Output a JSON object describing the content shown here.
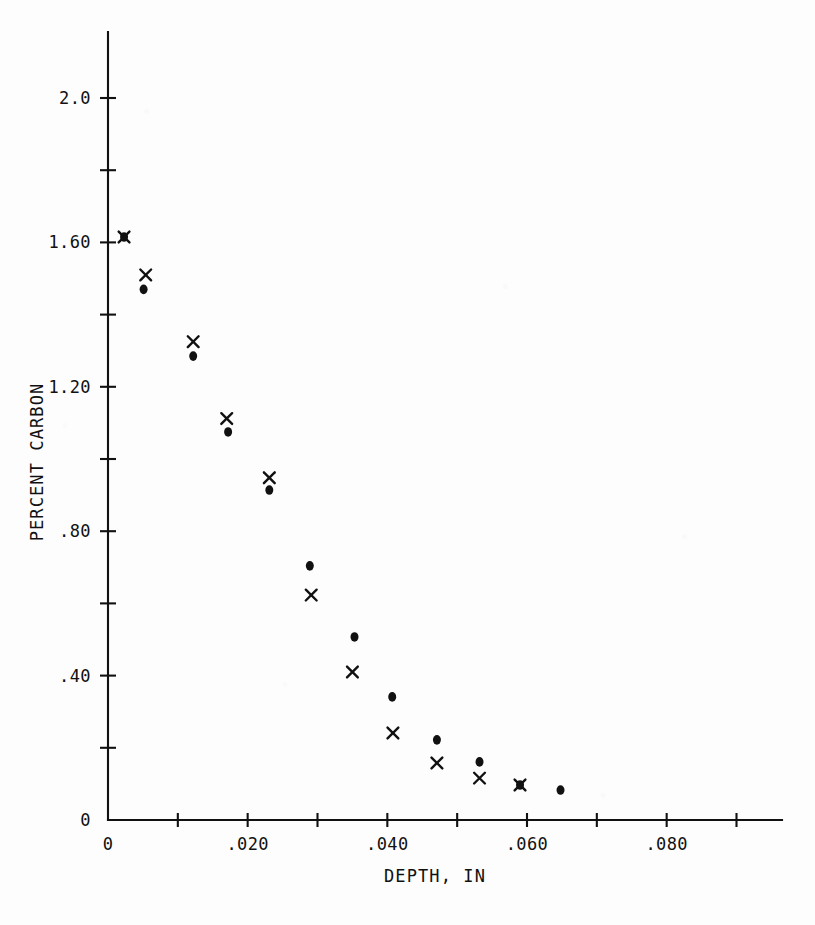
{
  "figure": {
    "background_color": "#fdfdfd",
    "ink_color": "#111111"
  },
  "axes": {
    "x": {
      "title": "DEPTH, IN",
      "tick_labels": [
        "0",
        ".020",
        ".040",
        ".060",
        ".080"
      ],
      "tick_values": [
        0,
        0.02,
        0.04,
        0.06,
        0.08
      ],
      "minor_tick_values": [
        0.01,
        0.03,
        0.05,
        0.07,
        0.09
      ],
      "range": [
        0,
        0.095
      ]
    },
    "y": {
      "title": "PERCENT CARBON",
      "tick_labels": [
        "0",
        ".40",
        ".80",
        "1.20",
        "1.60",
        "2.0"
      ],
      "tick_values": [
        0,
        0.4,
        0.8,
        1.2,
        1.6,
        2.0
      ],
      "minor_tick_values": [
        0.2,
        0.6,
        1.0,
        1.4,
        1.8
      ],
      "range": [
        0,
        2.2
      ]
    }
  },
  "chart_data": {
    "type": "scatter",
    "title": "",
    "xlabel": "DEPTH, IN",
    "ylabel": "PERCENT CARBON",
    "xlim": [
      0,
      0.095
    ],
    "ylim": [
      0,
      2.2
    ],
    "grid": false,
    "legend": "none",
    "series": [
      {
        "name": "x-series",
        "marker": "x",
        "points": [
          {
            "x": 0.0023,
            "y": 1.615
          },
          {
            "x": 0.0054,
            "y": 1.51
          },
          {
            "x": 0.0122,
            "y": 1.325
          },
          {
            "x": 0.017,
            "y": 1.112
          },
          {
            "x": 0.0231,
            "y": 0.948
          },
          {
            "x": 0.0291,
            "y": 0.623
          },
          {
            "x": 0.035,
            "y": 0.41
          },
          {
            "x": 0.0408,
            "y": 0.241
          },
          {
            "x": 0.0471,
            "y": 0.158
          },
          {
            "x": 0.0532,
            "y": 0.116
          },
          {
            "x": 0.059,
            "y": 0.097
          }
        ]
      },
      {
        "name": "dot-series",
        "marker": "filled-circle",
        "points": [
          {
            "x": 0.0023,
            "y": 1.615
          },
          {
            "x": 0.0051,
            "y": 1.47
          },
          {
            "x": 0.0122,
            "y": 1.285
          },
          {
            "x": 0.0172,
            "y": 1.075
          },
          {
            "x": 0.0231,
            "y": 0.914
          },
          {
            "x": 0.0289,
            "y": 0.704
          },
          {
            "x": 0.0353,
            "y": 0.507
          },
          {
            "x": 0.0407,
            "y": 0.341
          },
          {
            "x": 0.0471,
            "y": 0.222
          },
          {
            "x": 0.0532,
            "y": 0.161
          },
          {
            "x": 0.059,
            "y": 0.097
          },
          {
            "x": 0.0648,
            "y": 0.083
          }
        ]
      }
    ]
  }
}
